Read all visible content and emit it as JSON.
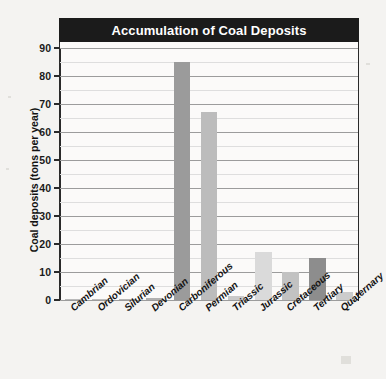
{
  "chart_data": {
    "type": "bar",
    "title": "Accumulation of Coal Deposits",
    "xlabel": "",
    "ylabel": "Coal deposits (tons per year)",
    "ylim": [
      0,
      90
    ],
    "ytick_step": 10,
    "yminor_step": 5,
    "grid": true,
    "legend": "none",
    "categories": [
      "Cambrian",
      "Ordovician",
      "Silurian",
      "Devonian",
      "Carboniferous",
      "Permian",
      "Triassic",
      "Jurassic",
      "Cretaceous",
      "Tertiary",
      "Quaternary"
    ],
    "values": [
      0.2,
      0.2,
      0.4,
      0.8,
      85,
      67,
      1.5,
      17,
      10,
      15,
      3
    ],
    "bar_colors": [
      "#b9b9b9",
      "#bdbdbd",
      "#b4b4b4",
      "#b0b0b0",
      "#9b9b9b",
      "#bcbcbc",
      "#c9c9c9",
      "#dadada",
      "#c2c2c2",
      "#8d8d8d",
      "#cccccc"
    ],
    "ytick_labels": [
      "0",
      "10",
      "20",
      "30",
      "40",
      "50",
      "60",
      "70",
      "80",
      "90"
    ]
  },
  "style": {
    "title_bg": "#1b1b1b",
    "title_fg": "#ffffff",
    "plot_bg": "#fbfaf9",
    "page_bg": "#f4f3f1",
    "axis_color": "#2a2a2a",
    "major_grid": "#9c9c9c",
    "minor_grid": "#dedede"
  }
}
